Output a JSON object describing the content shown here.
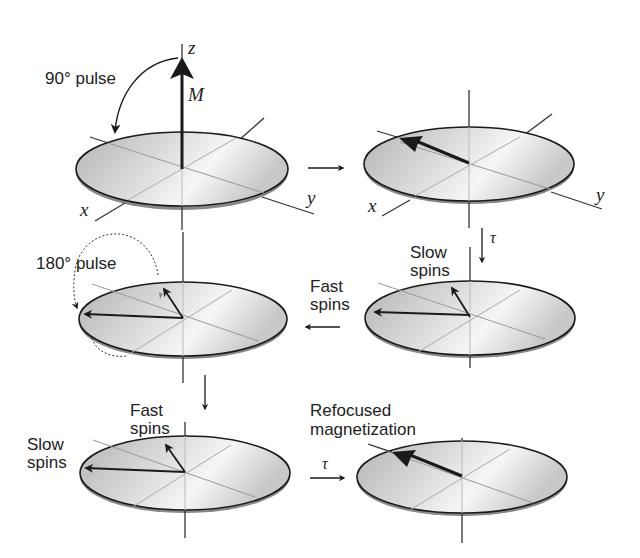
{
  "labels": {
    "pulse90": "90° pulse",
    "pulse180": "180° pulse",
    "axis_z": "z",
    "axis_x": "x",
    "axis_y": "y",
    "magnetization": "M",
    "tau": "τ",
    "slow_spins_line1": "Slow",
    "slow_spins_line2": "spins",
    "fast_spins_line1": "Fast",
    "fast_spins_line2": "spins",
    "refocused_line1": "Refocused",
    "refocused_line2": "magnetization"
  },
  "panels": [
    {
      "id": 1,
      "name": "initial-longitudinal-magnetization"
    },
    {
      "id": 2,
      "name": "after-90-pulse-transverse"
    },
    {
      "id": 3,
      "name": "after-180-pulse-inverted"
    },
    {
      "id": 4,
      "name": "dephasing-slow-fast-spins"
    },
    {
      "id": 5,
      "name": "rephasing-spins"
    },
    {
      "id": 6,
      "name": "refocused-echo"
    }
  ],
  "colors": {
    "disc_dark": "#b8b8b8",
    "disc_light": "#f4f4f4",
    "line": "#1a1a1a",
    "axis_light": "#9a9a9a"
  }
}
